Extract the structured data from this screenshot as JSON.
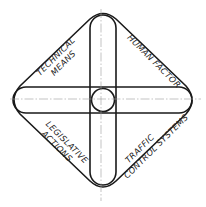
{
  "diagram": {
    "type": "intersecting-ovals-in-rounded-diamond",
    "quadrants": {
      "top_left": {
        "line1": "TECHNICAL",
        "line2": "MEANS"
      },
      "top_right": {
        "line1": "HUMAN FACTOR"
      },
      "bottom_left": {
        "line1": "LEGISLATIVE",
        "line2": "ACTIONS"
      },
      "bottom_right": {
        "line1": "TRAFFIC",
        "line2": "CONTROL SYSTEMS"
      }
    },
    "shapes": [
      "outer-rounded-diamond",
      "vertical-oval",
      "horizontal-oval",
      "center-circle",
      "vertical-center-axis",
      "horizontal-center-axis"
    ],
    "colors": {
      "stroke": "#1a1a1a",
      "axis": "#9a9a9a",
      "background": "#ffffff"
    }
  }
}
